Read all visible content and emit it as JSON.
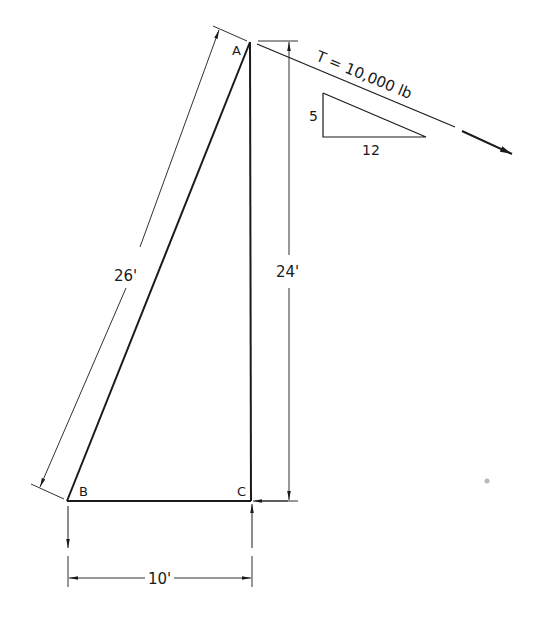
{
  "diagram": {
    "points": {
      "A": "A",
      "B": "B",
      "C": "C"
    },
    "dimensions": {
      "hypotenuse": "26'",
      "vertical": "24'",
      "horizontal": "10'"
    },
    "force": {
      "label": "T = 10,000 lb",
      "slope_rise": "5",
      "slope_run": "12"
    },
    "colors": {
      "ink": "#1a1a1a",
      "background": "#ffffff"
    }
  }
}
